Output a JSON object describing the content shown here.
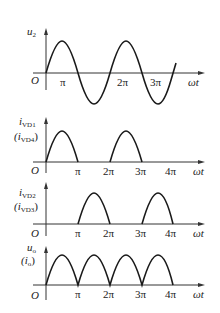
{
  "figure": {
    "colors": {
      "axis": "#333333",
      "wave": "#1a1a1a",
      "text": "#222222",
      "background": "#ffffff"
    },
    "x_axis_label": "ωt",
    "origin_label": "O",
    "tick_labels": [
      "π",
      "2π",
      "3π",
      "4π"
    ],
    "panels": [
      {
        "id": "u2",
        "y_label": "u",
        "y_label_sub": "2",
        "y_label_alt": "",
        "y_label_alt_sub": "",
        "waveform": "sine",
        "ticks_shown": [
          "π",
          "2π",
          "3π"
        ]
      },
      {
        "id": "ivd1",
        "y_label": "i",
        "y_label_sub": "VD1",
        "y_label_alt": "(i",
        "y_label_alt_sub": "VD4",
        "waveform": "positive half-cycles (0–π, 2π–3π)",
        "ticks_shown": [
          "π",
          "2π",
          "3π",
          "4π"
        ]
      },
      {
        "id": "ivd2",
        "y_label": "i",
        "y_label_sub": "VD2",
        "y_label_alt": "(i",
        "y_label_alt_sub": "VD3",
        "waveform": "negative half-cycles rectified (π–2π, 3π–4π)",
        "ticks_shown": [
          "π",
          "2π",
          "3π",
          "4π"
        ]
      },
      {
        "id": "uo",
        "y_label": "u",
        "y_label_sub": "o",
        "y_label_alt": "(i",
        "y_label_alt_sub": "o",
        "waveform": "full-wave rectified (0–4π)",
        "ticks_shown": [
          "π",
          "2π",
          "3π",
          "4π"
        ]
      }
    ]
  }
}
